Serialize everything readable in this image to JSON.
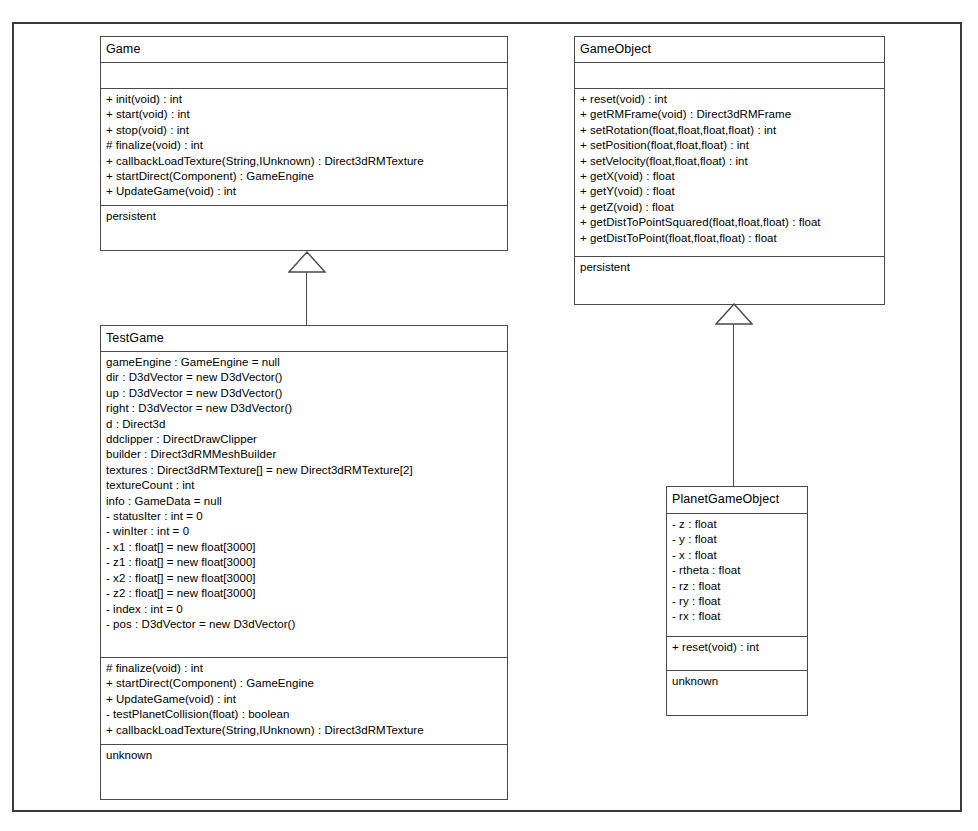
{
  "diagram": {
    "classes": [
      {
        "id": "game",
        "name": "Game",
        "attributes": [],
        "operations": [
          "+ init(void) : int",
          "+ start(void) : int",
          "+ stop(void) : int",
          "# finalize(void) : int",
          "+ callbackLoadTexture(String,IUnknown) : Direct3dRMTexture",
          "+ startDirect(Component) : GameEngine",
          "+ UpdateGame(void) : int"
        ],
        "stereotype": "persistent"
      },
      {
        "id": "gameobject",
        "name": "GameObject",
        "attributes": [],
        "operations": [
          "+ reset(void) : int",
          "+ getRMFrame(void) : Direct3dRMFrame",
          "+ setRotation(float,float,float,float) : int",
          "+ setPosition(float,float,float) : int",
          "+ setVelocity(float,float,float) : int",
          "+ getX(void) : float",
          "+ getY(void) : float",
          "+ getZ(void) : float",
          "+ getDistToPointSquared(float,float,float) : float",
          "+ getDistToPoint(float,float,float) : float"
        ],
        "stereotype": "persistent"
      },
      {
        "id": "testgame",
        "name": "TestGame",
        "attributes": [
          "gameEngine : GameEngine = null",
          "dir : D3dVector = new D3dVector()",
          "up : D3dVector = new D3dVector()",
          "right : D3dVector = new D3dVector()",
          "d : Direct3d",
          "ddclipper : DirectDrawClipper",
          "builder : Direct3dRMMeshBuilder",
          "textures : Direct3dRMTexture[] = new Direct3dRMTexture[2]",
          "textureCount : int",
          "info : GameData = null",
          "- statusIter : int = 0",
          "- winIter : int = 0",
          "- x1 : float[] = new float[3000]",
          "- z1 : float[] = new float[3000]",
          "- x2 : float[] = new float[3000]",
          "- z2 : float[] = new float[3000]",
          "- index : int = 0",
          "- pos : D3dVector = new D3dVector()"
        ],
        "operations": [
          "# finalize(void) : int",
          "+ startDirect(Component) : GameEngine",
          "+ UpdateGame(void) : int",
          "- testPlanetCollision(float) : boolean",
          "+ callbackLoadTexture(String,IUnknown) : Direct3dRMTexture"
        ],
        "stereotype": "unknown"
      },
      {
        "id": "planetgameobject",
        "name": "PlanetGameObject",
        "attributes": [
          "- z : float",
          "- y : float",
          "- x : float",
          "- rtheta : float",
          "- rz : float",
          "- ry : float",
          "- rx : float"
        ],
        "operations": [
          "+ reset(void) : int"
        ],
        "stereotype": "unknown"
      }
    ],
    "generalizations": [
      {
        "id": "gen-game",
        "child": "TestGame",
        "parent": "Game"
      },
      {
        "id": "gen-gameobject",
        "child": "PlanetGameObject",
        "parent": "GameObject"
      }
    ],
    "colors": {
      "line": "#4a4a4a",
      "frame": "#3a3a3a",
      "background": "#ffffff",
      "text": "#000000"
    }
  }
}
